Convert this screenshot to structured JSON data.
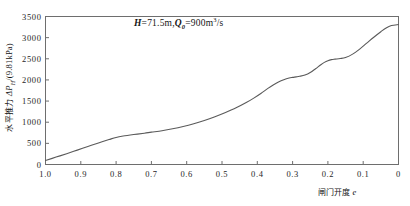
{
  "chart_data": {
    "type": "line",
    "title": "",
    "annotation": "H=71.5m, Q₀=900m³/s",
    "annotation_parts": {
      "h_symbol": "H",
      "h_value": "=71.5m,",
      "q_symbol": "Q",
      "q_sub": "0",
      "q_value": "=900m",
      "q_exp": "3",
      "q_unit": "/s"
    },
    "xlabel": "闸门开度 e",
    "xlabel_text": "闸门开度",
    "xlabel_symbol": "e",
    "ylabel": "水平推力 ΔP_H/(9.81kPa)",
    "ylabel_text": "水平推力",
    "ylabel_math_delta": "ΔP",
    "ylabel_math_sub": "H",
    "ylabel_unit": "/(9.81kPa)",
    "xlim": [
      1.0,
      0.0
    ],
    "ylim": [
      0,
      3500
    ],
    "x_reversed": true,
    "grid": false,
    "legend": null,
    "xticks": [
      1.0,
      0.9,
      0.8,
      0.7,
      0.6,
      0.5,
      0.4,
      0.3,
      0.2,
      0.1,
      0.0
    ],
    "xtick_labels": [
      "1.0",
      "0.9",
      "0.8",
      "0.7",
      "0.6",
      "0.5",
      "0.4",
      "0.3",
      "0.2",
      "0.1",
      "0"
    ],
    "yticks": [
      0,
      500,
      1000,
      1500,
      2000,
      2500,
      3000,
      3500
    ],
    "ytick_labels": [
      "0",
      "500",
      "1000",
      "1500",
      "2000",
      "2500",
      "3000",
      "3500"
    ],
    "series": [
      {
        "name": "horizontal-thrust",
        "x": [
          1.0,
          0.97,
          0.94,
          0.91,
          0.88,
          0.85,
          0.82,
          0.8,
          0.78,
          0.75,
          0.72,
          0.7,
          0.67,
          0.64,
          0.61,
          0.58,
          0.55,
          0.52,
          0.49,
          0.46,
          0.43,
          0.41,
          0.39,
          0.37,
          0.355,
          0.34,
          0.325,
          0.31,
          0.3,
          0.29,
          0.28,
          0.265,
          0.25,
          0.235,
          0.22,
          0.21,
          0.2,
          0.19,
          0.18,
          0.165,
          0.15,
          0.13,
          0.11,
          0.09,
          0.07,
          0.05,
          0.035,
          0.02,
          0.0
        ],
        "y": [
          95,
          175,
          255,
          340,
          425,
          510,
          590,
          640,
          672,
          708,
          740,
          765,
          800,
          845,
          900,
          965,
          1040,
          1130,
          1230,
          1340,
          1470,
          1570,
          1680,
          1800,
          1880,
          1950,
          2005,
          2045,
          2060,
          2072,
          2085,
          2115,
          2175,
          2265,
          2360,
          2415,
          2455,
          2480,
          2492,
          2505,
          2530,
          2610,
          2730,
          2870,
          3010,
          3140,
          3230,
          3285,
          3310
        ]
      }
    ]
  },
  "axes": {
    "frame_color": "#6e6e6e",
    "curve_color": "#5a5a5a",
    "background": "#ffffff"
  }
}
